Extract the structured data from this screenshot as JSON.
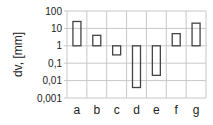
{
  "chart_data": {
    "type": "bar",
    "subtype": "floating-range-log",
    "title": "",
    "xlabel": "",
    "ylabel": "dv, [mm]",
    "yscale": "log",
    "ylim": [
      0.001,
      100
    ],
    "yticks": [
      "100",
      "10",
      "1",
      "0,1",
      "0,01",
      "0,001"
    ],
    "grid": true,
    "categories": [
      "a",
      "b",
      "c",
      "d",
      "e",
      "f",
      "g"
    ],
    "series": [
      {
        "name": "max",
        "values": [
          25,
          4,
          1,
          1,
          1,
          5,
          20
        ]
      },
      {
        "name": "min",
        "values": [
          1,
          1,
          0.3,
          0.004,
          0.02,
          1,
          1
        ]
      }
    ],
    "colors": {
      "box": "#444444",
      "grid": "#c8c8c8",
      "text": "#222222"
    }
  }
}
